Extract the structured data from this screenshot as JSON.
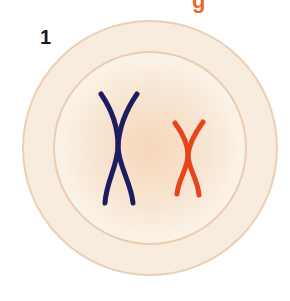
{
  "header": {
    "title_fragment": "g"
  },
  "diagram": {
    "step_number": "1",
    "cell": {
      "outer_membrane_color": "#f7ecde",
      "outer_stroke_color": "#ecceb4",
      "nucleus_fill_center": "#f6d8bd",
      "nucleus_fill_edge": "#faf1e6",
      "nucleus_stroke_color": "#ecccb0"
    },
    "chromosomes": [
      {
        "name": "large-chromosome",
        "color": "#1e1c5e"
      },
      {
        "name": "small-chromosome",
        "color": "#e8441c"
      }
    ]
  }
}
